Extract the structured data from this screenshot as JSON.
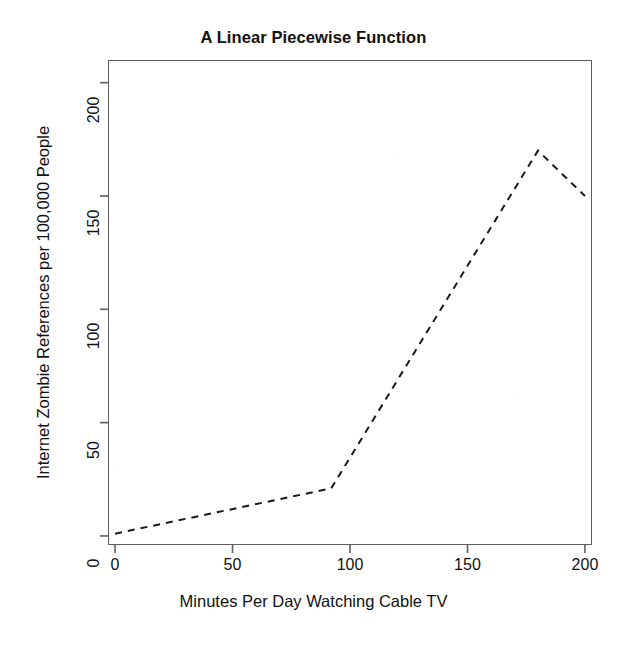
{
  "chart_data": {
    "type": "line",
    "title": "A Linear Piecewise Function",
    "xlabel": "Minutes Per Day Watching Cable TV",
    "ylabel": "Internet Zombie References per 100,000 People",
    "x": [
      0,
      92,
      180,
      200
    ],
    "values": [
      1,
      21,
      170,
      150
    ],
    "series": [
      {
        "name": "piecewise-linear",
        "x": [
          0,
          92,
          180,
          200
        ],
        "values": [
          1,
          21,
          170,
          150
        ],
        "linestyle": "dashed",
        "color": "#1a1a1a",
        "linewidth": 2,
        "markers": "none"
      }
    ],
    "xlim": [
      -3,
      203
    ],
    "ylim": [
      -4,
      210
    ],
    "xticks": [
      0,
      50,
      100,
      150,
      200
    ],
    "yticks": [
      0,
      50,
      100,
      150,
      200
    ],
    "xtick_labels": [
      "0",
      "50",
      "100",
      "150",
      "200"
    ],
    "ytick_labels": [
      "0",
      "50",
      "100",
      "150",
      "200"
    ],
    "grid": false,
    "legend": "none",
    "frame": "box",
    "frame_color": "#5e5e5e",
    "background": "#ffffff",
    "breakpoints": [
      {
        "x": 0,
        "y": 1
      },
      {
        "x": 92,
        "y": 21
      },
      {
        "x": 180,
        "y": 170
      },
      {
        "x": 200,
        "y": 150
      }
    ],
    "annotations": []
  }
}
